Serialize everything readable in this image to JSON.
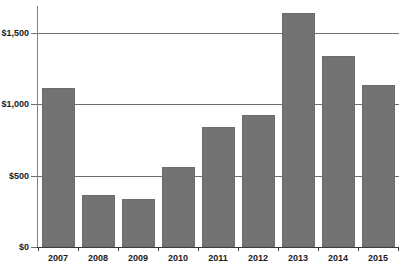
{
  "chart_data": {
    "type": "bar",
    "title": "",
    "subtitle": "",
    "xlabel": "",
    "ylabel": "",
    "categories": [
      "2007",
      "2008",
      "2009",
      "2010",
      "2011",
      "2012",
      "2013",
      "2014",
      "2015"
    ],
    "values": [
      1115,
      365,
      335,
      560,
      840,
      925,
      1640,
      1340,
      1135
    ],
    "series": [
      {
        "name": "",
        "values": [
          1115,
          365,
          335,
          560,
          840,
          925,
          1640,
          1340,
          1135
        ]
      }
    ],
    "ylim": [
      0,
      1700
    ],
    "ytick_values": [
      0,
      500,
      1000,
      1500
    ],
    "ytick_labels": [
      "$0",
      "$500",
      "$1,000",
      "$1,500"
    ],
    "grid": "horizontal",
    "legend": "none",
    "bar_color": "#737373",
    "gridline_color": "#6e6e6e",
    "axis_color": "#3c3c3c",
    "background_color": "#ffffff",
    "annotations": []
  }
}
